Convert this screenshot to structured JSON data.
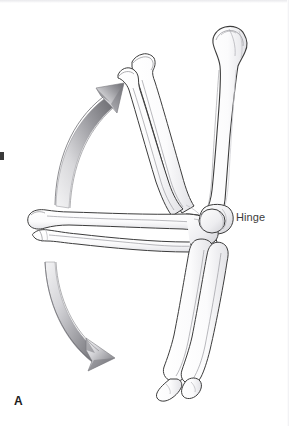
{
  "figure": {
    "panel_label": "A",
    "background_color": "#ffffff"
  },
  "annotations": {
    "hinge_label": "Hinge",
    "hinge_label_color": "#3b3b3b"
  },
  "bones": {
    "humerus": {
      "name": "humerus",
      "outline_color": "#3c3c3c",
      "fill_color": "#fefefe",
      "shading_color": "#d8d8dc"
    },
    "forearm_extended": {
      "name": "radius-and-ulna-extended",
      "outline_color": "#3c3c3c",
      "fill_color": "#fefefe"
    },
    "forearm_flexed_up": {
      "name": "radius-and-ulna-flexed",
      "outline_color": "#3c3c3c",
      "fill_color": "#fefefe"
    },
    "forearm_down": {
      "name": "radius-and-ulna-hyperextended",
      "outline_color": "#3c3c3c",
      "fill_color": "#fefefe"
    }
  },
  "arrows": {
    "upper": {
      "name": "flexion-arrow",
      "direction": "up-right",
      "color_start": "#f2f2f3",
      "color_end": "#6e6e72"
    },
    "lower": {
      "name": "extension-arrow",
      "direction": "down-right",
      "color_start": "#f2f2f3",
      "color_end": "#6e6e72"
    }
  }
}
